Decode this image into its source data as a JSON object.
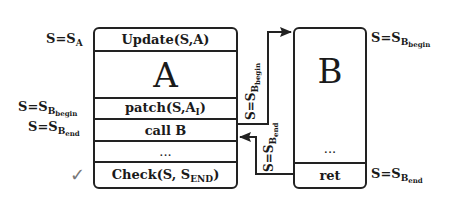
{
  "diagram": {
    "box_a": {
      "rows": [
        {
          "label": "Update(S,A)"
        },
        {
          "label": "A"
        },
        {
          "label": "patch(S,A",
          "sub": "I",
          "suffix": ")"
        },
        {
          "label": "call B"
        },
        {
          "label": "..."
        },
        {
          "label": "Check(S, S",
          "sub": "END",
          "suffix": ")"
        }
      ]
    },
    "box_b": {
      "title": "B",
      "middle": "...",
      "footer": "ret"
    },
    "left_labels": [
      {
        "prefix": "S=S",
        "sub": "A"
      },
      {
        "prefix": "S=S",
        "sub": "B",
        "subsub": "begin"
      },
      {
        "prefix": "S=S",
        "sub": "B",
        "subsub": "end"
      }
    ],
    "right_labels": [
      {
        "prefix": "S=S",
        "sub": "B",
        "subsub": "begin"
      },
      {
        "prefix": "S=S",
        "sub": "B",
        "subsub": "end"
      }
    ],
    "arrow_labels": [
      {
        "prefix": "S=S",
        "sub": "B",
        "subsub": "begin"
      },
      {
        "prefix": "S=S",
        "sub": "B",
        "subsub": "end"
      }
    ],
    "check_mark": "✓",
    "colors": {
      "stroke": "#222222",
      "check": "#777777"
    }
  }
}
